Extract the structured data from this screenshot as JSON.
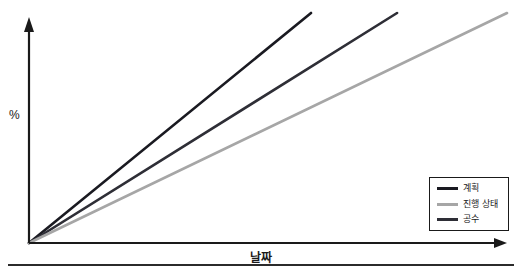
{
  "chart_data": {
    "type": "line",
    "title": "",
    "xlabel": "날짜",
    "ylabel": "%",
    "grid": false,
    "legend_position": "lower right",
    "axes_style": "arrow-axes-from-origin",
    "x_range_frac": [
      0,
      1
    ],
    "y_range_frac": [
      0,
      1
    ],
    "series": [
      {
        "name": "계획",
        "color": "#1a1a21",
        "points_frac": [
          [
            0,
            0
          ],
          [
            0.59,
            1.0
          ]
        ]
      },
      {
        "name": "진행 상태",
        "color": "#a6a6a6",
        "points_frac": [
          [
            0,
            0
          ],
          [
            1.0,
            1.0
          ]
        ]
      },
      {
        "name": "공수",
        "color": "#2e2e36",
        "points_frac": [
          [
            0,
            0
          ],
          [
            0.77,
            1.0
          ]
        ]
      }
    ],
    "draw_order": [
      "계획",
      "공수",
      "진행 상태"
    ],
    "axis_color": "#1a1a1a"
  }
}
